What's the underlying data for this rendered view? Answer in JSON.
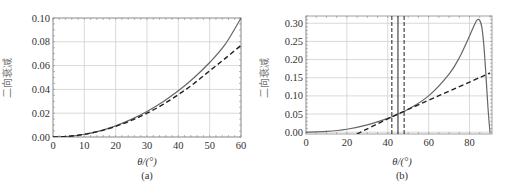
{
  "chart_data": [
    {
      "type": "line",
      "panel": "(a)",
      "caption": "(a)",
      "xlabel": "θ/(°)",
      "ylabel": "二向衰减",
      "xlim": [
        0,
        60
      ],
      "ylim": [
        0,
        0.1
      ],
      "xticks": [
        0,
        10,
        20,
        30,
        40,
        50,
        60
      ],
      "yticks": [
        "0.00",
        "0.02",
        "0.04",
        "0.06",
        "0.08",
        "0.10"
      ],
      "grid": true,
      "series": [
        {
          "name": "exact",
          "style": "solid",
          "color": "#666666",
          "x": [
            0,
            5,
            10,
            15,
            20,
            25,
            30,
            35,
            40,
            45,
            50,
            55,
            60
          ],
          "y": [
            0.0,
            0.0006,
            0.0023,
            0.0052,
            0.0094,
            0.0148,
            0.0214,
            0.0294,
            0.0388,
            0.0498,
            0.0626,
            0.078,
            0.1
          ]
        },
        {
          "name": "approximation",
          "style": "dashed",
          "color": "#222222",
          "x": [
            0,
            5,
            10,
            15,
            20,
            25,
            30,
            35,
            40,
            45,
            50,
            55,
            60
          ],
          "y": [
            0.0,
            0.0006,
            0.0022,
            0.005,
            0.0089,
            0.0139,
            0.02,
            0.0272,
            0.0356,
            0.045,
            0.0556,
            0.0661,
            0.077
          ]
        }
      ]
    },
    {
      "type": "line",
      "panel": "(b)",
      "caption": "(b)",
      "xlabel": "θ/(°)",
      "ylabel": "二向衰减",
      "xlim": [
        0,
        91
      ],
      "ylim": [
        -0.005,
        0.32
      ],
      "xticks": [
        0,
        20,
        40,
        60,
        80
      ],
      "yticks": [
        "0.00",
        "0.05",
        "0.10",
        "0.15",
        "0.20",
        "0.25",
        "0.30"
      ],
      "grid": true,
      "vlines": [
        {
          "x": 42,
          "style": "dashed"
        },
        {
          "x": 45,
          "style": "solid"
        },
        {
          "x": 48,
          "style": "dashed"
        }
      ],
      "series": [
        {
          "name": "exact",
          "style": "solid",
          "color": "#666666",
          "x": [
            0,
            10,
            20,
            30,
            40,
            45,
            50,
            60,
            70,
            75,
            80,
            83,
            84,
            85,
            86,
            87,
            88,
            89,
            90
          ],
          "y": [
            0.0,
            0.002,
            0.008,
            0.02,
            0.038,
            0.05,
            0.063,
            0.1,
            0.16,
            0.205,
            0.265,
            0.303,
            0.31,
            0.308,
            0.29,
            0.24,
            0.16,
            0.07,
            0.0
          ]
        },
        {
          "name": "linear-approximation",
          "style": "dashed",
          "color": "#222222",
          "x": [
            25,
            45,
            90
          ],
          "y": [
            -0.005,
            0.05,
            0.163
          ]
        }
      ]
    }
  ],
  "figure": {
    "panel_a": {
      "caption": "(a)",
      "xlabel": "θ/(°)",
      "ylabel": "二向衰减"
    },
    "panel_b": {
      "caption": "(b)",
      "xlabel": "θ/(°)",
      "ylabel": "二向衰减"
    }
  }
}
